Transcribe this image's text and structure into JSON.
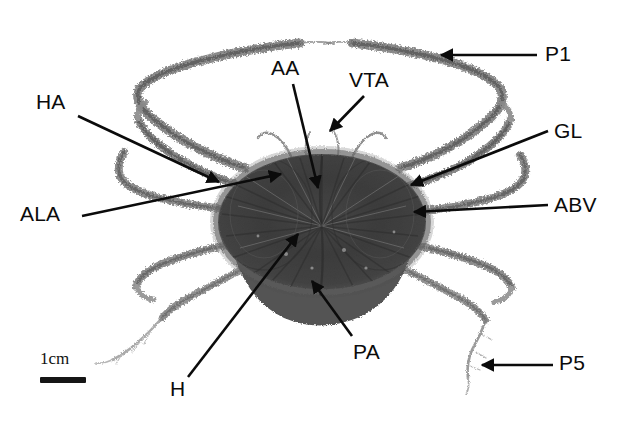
{
  "figure": {
    "kind": "scientific-specimen-photograph",
    "background_color": "#ffffff",
    "ink_color": "#0b0b0b",
    "width_px": 628,
    "height_px": 422
  },
  "scale": {
    "caption": "1cm",
    "bar_color": "#151515"
  },
  "labels": [
    {
      "key": "P1",
      "text": "P1",
      "x": 545,
      "y": 43,
      "pointer": "arrow-horizontal-left"
    },
    {
      "key": "VTA",
      "text": "VTA",
      "x": 349,
      "y": 69,
      "pointer": "arrow-diagonal-down-left"
    },
    {
      "key": "AA",
      "text": "AA",
      "x": 271,
      "y": 57,
      "pointer": "line-down"
    },
    {
      "key": "HA",
      "text": "HA",
      "x": 36,
      "y": 91,
      "pointer": "arrow-down-right"
    },
    {
      "key": "GL",
      "text": "GL",
      "x": 554,
      "y": 120,
      "pointer": "line-down-left"
    },
    {
      "key": "ABV",
      "text": "ABV",
      "x": 554,
      "y": 194,
      "pointer": "arrow-left"
    },
    {
      "key": "ALA",
      "text": "ALA",
      "x": 20,
      "y": 203,
      "pointer": "line-up-right"
    },
    {
      "key": "PA",
      "text": "PA",
      "x": 353,
      "y": 341,
      "pointer": "arrow-up-left"
    },
    {
      "key": "H",
      "text": "H",
      "x": 170,
      "y": 378,
      "pointer": "line-up-right"
    },
    {
      "key": "P5",
      "text": "P5",
      "x": 559,
      "y": 352,
      "pointer": "arrow-horizontal-left"
    }
  ],
  "legend_meaning": {
    "P1": "first pereopod / cheliped",
    "P5": "fifth pereopod",
    "HA": "hepatic area",
    "ALA": "anterolateral area",
    "AA": "anterior area",
    "VTA": "ventral thoracic appendage region",
    "GL": "gill lamella",
    "ABV": "abdominal / branchial vestige",
    "PA": "posterior area",
    "H": "heart region"
  }
}
